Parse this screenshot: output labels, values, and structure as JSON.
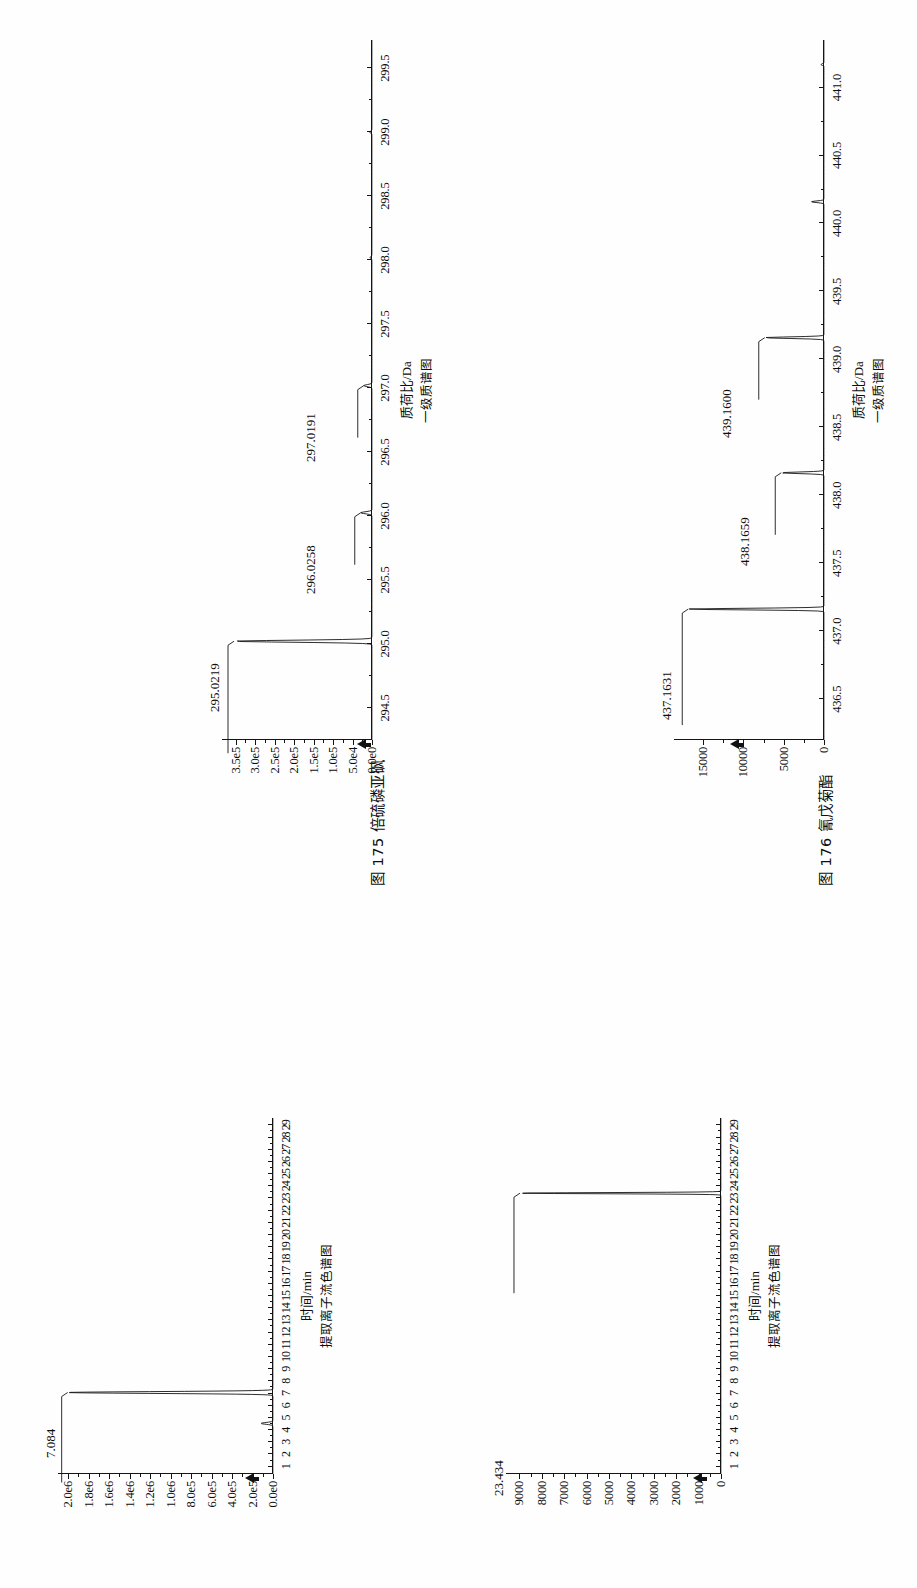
{
  "page": {
    "orientation": "rotated-90-ccw",
    "background": "#fefefe",
    "ink": "#111111"
  },
  "figures": [
    {
      "id": "fig-175",
      "caption_prefix": "图",
      "caption_number": "175",
      "caption_name": "倍硫磷亚砜",
      "caption_full": "图 175  倍硫磷亚砜"
    },
    {
      "id": "fig-176",
      "caption_prefix": "图",
      "caption_number": "176",
      "caption_name": "氰戊菊酯",
      "caption_full": "图 176  氰戊菊酯"
    }
  ],
  "chart_data": [
    {
      "id": "chrom-175",
      "type": "line",
      "title": "",
      "subtitle": "提取离子流色谱图",
      "xlabel": "时间/min",
      "ylabel": "",
      "x_ticks": [
        "1",
        "2",
        "3",
        "4",
        "5",
        "6",
        "7",
        "8",
        "9",
        "10",
        "11",
        "12",
        "13",
        "14",
        "15",
        "16",
        "17",
        "18",
        "19",
        "20",
        "21",
        "22",
        "23",
        "24",
        "25",
        "26",
        "27",
        "28",
        "29"
      ],
      "xlim": [
        0.4,
        29.6
      ],
      "y_ticks": [
        "0.0e0",
        "2.0e5",
        "4.0e5",
        "6.0e5",
        "8.0e5",
        "1.0e6",
        "1.2e6",
        "1.4e6",
        "1.6e6",
        "1.8e6",
        "2.0e6"
      ],
      "y_values": [
        0,
        200000,
        400000,
        600000,
        800000,
        1000000,
        1200000,
        1400000,
        1600000,
        1800000,
        2000000
      ],
      "ylim": [
        0,
        2100000
      ],
      "grid": false,
      "legend": "none",
      "annotations": [
        {
          "text": "7.084",
          "x": 7.084,
          "y": 2000000
        }
      ],
      "peaks": [
        {
          "x": 4.55,
          "height": 0.055
        },
        {
          "x": 7.084,
          "height": 0.955
        }
      ]
    },
    {
      "id": "ms-175",
      "type": "line",
      "title": "",
      "subtitle": "一级质谱图",
      "xlabel": "质荷比/Da",
      "ylabel": "",
      "x_ticks": [
        "294.5",
        "295.0",
        "295.5",
        "296.0",
        "296.5",
        "297.0",
        "297.5",
        "298.0",
        "298.5",
        "299.0",
        "299.5"
      ],
      "xlim": [
        294.25,
        299.72
      ],
      "y_ticks": [
        "0.0e0",
        "5.0e4",
        "1.0e5",
        "1.5e5",
        "2.0e5",
        "2.5e5",
        "3.0e5",
        "3.5e5"
      ],
      "y_values": [
        0,
        50000,
        100000,
        150000,
        200000,
        250000,
        300000,
        350000
      ],
      "ylim": [
        0,
        385000
      ],
      "grid": false,
      "legend": "none",
      "annotations": [
        {
          "text": "295.0219",
          "x": 295.0219,
          "y": 350000
        },
        {
          "text": "296.0258",
          "x": 296.0258,
          "y": 60000
        },
        {
          "text": "297.0191",
          "x": 297.0191,
          "y": 45000
        }
      ],
      "peaks": [
        {
          "x": 295.0219,
          "height": 0.92
        },
        {
          "x": 296.0258,
          "height": 0.075
        },
        {
          "x": 297.0191,
          "height": 0.055
        },
        {
          "x": 298.02,
          "height": 0.012
        },
        {
          "x": 299.0,
          "height": 0.014
        }
      ]
    },
    {
      "id": "chrom-176",
      "type": "line",
      "title": "",
      "subtitle": "提取离子流色谱图",
      "xlabel": "时间/min",
      "ylabel": "",
      "x_ticks": [
        "1",
        "2",
        "3",
        "4",
        "5",
        "6",
        "7",
        "8",
        "9",
        "10",
        "11",
        "12",
        "13",
        "14",
        "15",
        "16",
        "17",
        "18",
        "19",
        "20",
        "21",
        "22",
        "23",
        "24",
        "25",
        "26",
        "27",
        "28",
        "29"
      ],
      "xlim": [
        0.4,
        29.6
      ],
      "y_ticks": [
        "0",
        "1000",
        "2000",
        "3000",
        "4000",
        "5000",
        "6000",
        "7000",
        "8000",
        "9000"
      ],
      "y_values": [
        0,
        1000,
        2000,
        3000,
        4000,
        5000,
        6000,
        7000,
        8000,
        9000
      ],
      "ylim": [
        0,
        9600
      ],
      "grid": false,
      "legend": "none",
      "annotations": [
        {
          "text": "23.434",
          "x": 23.434,
          "y": 8900
        }
      ],
      "peaks": [
        {
          "x": 23.434,
          "height": 0.935
        }
      ]
    },
    {
      "id": "ms-176",
      "type": "line",
      "title": "",
      "subtitle": "一级质谱图",
      "xlabel": "质荷比/Da",
      "ylabel": "",
      "x_ticks": [
        "436.5",
        "437.0",
        "437.5",
        "438.0",
        "438.5",
        "439.0",
        "439.5",
        "440.0",
        "440.5",
        "441.0"
      ],
      "xlim": [
        436.2,
        441.35
      ],
      "y_ticks": [
        "0",
        "5000",
        "10000",
        "15000"
      ],
      "y_values": [
        0,
        5000,
        10000,
        15000
      ],
      "ylim": [
        0,
        18600
      ],
      "grid": false,
      "legend": "none",
      "annotations": [
        {
          "text": "437.1631",
          "x": 437.1631,
          "y": 17000
        },
        {
          "text": "438.1659",
          "x": 438.1659,
          "y": 5600
        },
        {
          "text": "439.1600",
          "x": 439.16,
          "y": 7200
        }
      ],
      "peaks": [
        {
          "x": 437.1631,
          "height": 0.905
        },
        {
          "x": 438.1659,
          "height": 0.285
        },
        {
          "x": 439.16,
          "height": 0.395
        },
        {
          "x": 440.16,
          "height": 0.085
        },
        {
          "x": 441.17,
          "height": 0.02
        }
      ]
    }
  ]
}
